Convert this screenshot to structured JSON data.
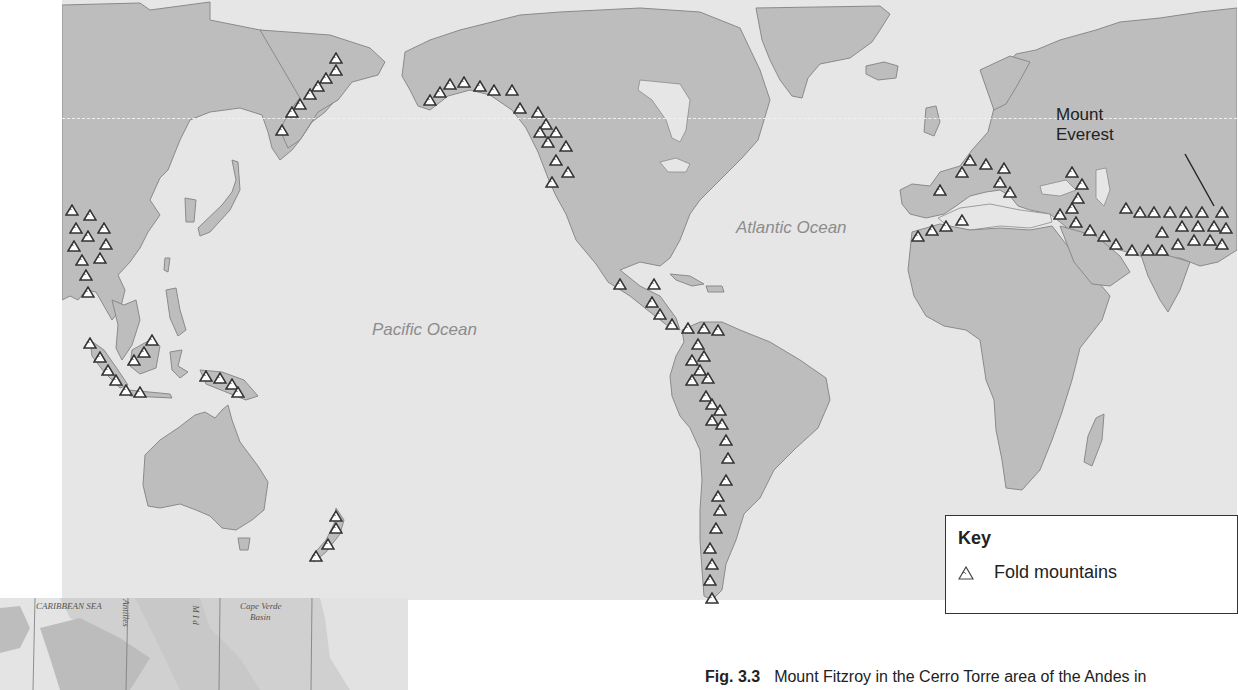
{
  "map": {
    "title": "Global distribution of fold mountains",
    "ocean_labels": [
      {
        "text": "Pacific Ocean",
        "x": 372,
        "y": 320
      },
      {
        "text": "Atlantic Ocean",
        "x": 736,
        "y": 218
      }
    ],
    "annotation": {
      "line1": "Mount",
      "line2": "Everest"
    },
    "colors": {
      "land": "#bdbdbd",
      "sea": "#e6e6e6",
      "coast": "#8a8a8a",
      "symbol_fill": "#ffffff",
      "symbol_stroke": "#333333"
    },
    "fold_mountain_symbols": [
      [
        72,
        210
      ],
      [
        90,
        215
      ],
      [
        104,
        228
      ],
      [
        76,
        228
      ],
      [
        88,
        236
      ],
      [
        106,
        244
      ],
      [
        74,
        246
      ],
      [
        82,
        260
      ],
      [
        100,
        258
      ],
      [
        86,
        275
      ],
      [
        88,
        292
      ],
      [
        90,
        343
      ],
      [
        100,
        357
      ],
      [
        108,
        370
      ],
      [
        116,
        380
      ],
      [
        126,
        390
      ],
      [
        140,
        392
      ],
      [
        134,
        360
      ],
      [
        144,
        352
      ],
      [
        152,
        340
      ],
      [
        206,
        376
      ],
      [
        220,
        378
      ],
      [
        232,
        384
      ],
      [
        238,
        392
      ],
      [
        282,
        130
      ],
      [
        292,
        112
      ],
      [
        300,
        104
      ],
      [
        310,
        94
      ],
      [
        318,
        86
      ],
      [
        326,
        78
      ],
      [
        336,
        70
      ],
      [
        336,
        58
      ],
      [
        430,
        100
      ],
      [
        440,
        92
      ],
      [
        450,
        84
      ],
      [
        464,
        82
      ],
      [
        480,
        86
      ],
      [
        494,
        90
      ],
      [
        512,
        90
      ],
      [
        520,
        108
      ],
      [
        538,
        112
      ],
      [
        546,
        124
      ],
      [
        556,
        132
      ],
      [
        540,
        132
      ],
      [
        548,
        142
      ],
      [
        566,
        146
      ],
      [
        556,
        160
      ],
      [
        568,
        172
      ],
      [
        552,
        182
      ],
      [
        620,
        284
      ],
      [
        654,
        284
      ],
      [
        652,
        302
      ],
      [
        660,
        314
      ],
      [
        672,
        324
      ],
      [
        688,
        328
      ],
      [
        704,
        328
      ],
      [
        718,
        330
      ],
      [
        698,
        344
      ],
      [
        704,
        356
      ],
      [
        692,
        360
      ],
      [
        700,
        370
      ],
      [
        692,
        380
      ],
      [
        708,
        378
      ],
      [
        706,
        396
      ],
      [
        712,
        404
      ],
      [
        720,
        410
      ],
      [
        712,
        420
      ],
      [
        722,
        424
      ],
      [
        726,
        440
      ],
      [
        728,
        458
      ],
      [
        726,
        480
      ],
      [
        718,
        496
      ],
      [
        720,
        510
      ],
      [
        716,
        528
      ],
      [
        710,
        548
      ],
      [
        712,
        564
      ],
      [
        710,
        580
      ],
      [
        712,
        598
      ],
      [
        316,
        556
      ],
      [
        328,
        544
      ],
      [
        336,
        528
      ],
      [
        336,
        516
      ],
      [
        918,
        236
      ],
      [
        932,
        230
      ],
      [
        946,
        226
      ],
      [
        962,
        220
      ],
      [
        940,
        190
      ],
      [
        962,
        172
      ],
      [
        970,
        160
      ],
      [
        986,
        164
      ],
      [
        1004,
        168
      ],
      [
        1000,
        182
      ],
      [
        1010,
        192
      ],
      [
        1072,
        172
      ],
      [
        1082,
        184
      ],
      [
        1078,
        198
      ],
      [
        1072,
        208
      ],
      [
        1060,
        214
      ],
      [
        1076,
        222
      ],
      [
        1090,
        230
      ],
      [
        1104,
        236
      ],
      [
        1116,
        244
      ],
      [
        1132,
        250
      ],
      [
        1148,
        250
      ],
      [
        1162,
        250
      ],
      [
        1178,
        244
      ],
      [
        1194,
        240
      ],
      [
        1210,
        240
      ],
      [
        1222,
        244
      ],
      [
        1126,
        208
      ],
      [
        1140,
        212
      ],
      [
        1154,
        212
      ],
      [
        1170,
        212
      ],
      [
        1186,
        212
      ],
      [
        1202,
        212
      ],
      [
        1222,
        212
      ],
      [
        1162,
        232
      ],
      [
        1182,
        226
      ],
      [
        1198,
        226
      ],
      [
        1214,
        226
      ],
      [
        1226,
        228
      ]
    ]
  },
  "key": {
    "title": "Key",
    "items": [
      {
        "symbol": "fold-mountain-triangle-icon",
        "label": "Fold mountains"
      }
    ]
  },
  "caption": {
    "figure_number": "Fig. 3.3",
    "text": "Mount Fitzroy in the Cerro Torre area of the Andes in"
  },
  "inset_map": {
    "labels": [
      "CARIBBEAN SEA",
      "Antilles",
      "M I d",
      "Cape Verde",
      "Basin"
    ]
  }
}
